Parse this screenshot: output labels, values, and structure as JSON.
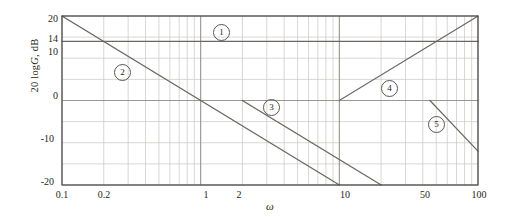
{
  "figure": {
    "type": "bode-magnitude-plot",
    "axes": {
      "y_label": "20 log|G|, dB",
      "y_label_prefix": "20 log",
      "y_label_italic": "G",
      "y_label_suffix": ", dB",
      "x_label": "ω",
      "y_ticks": [
        "20",
        "14",
        "10",
        "0",
        "-10",
        "-20"
      ],
      "y_tick_values": [
        20,
        14,
        10,
        0,
        -10,
        -20
      ],
      "x_ticks": [
        "0.1",
        "0.2",
        "1",
        "2",
        "10",
        "50",
        "100"
      ],
      "x_tick_values": [
        0.1,
        0.2,
        1,
        2,
        10,
        50,
        100
      ],
      "ylim": [
        -20,
        20
      ],
      "xlim": [
        0.1,
        100
      ],
      "xscale": "log",
      "grid": "on"
    },
    "curve_labels": [
      {
        "id": "1",
        "glyph": "①",
        "text": "1"
      },
      {
        "id": "2",
        "glyph": "②",
        "text": "2"
      },
      {
        "id": "3",
        "glyph": "③",
        "text": "3"
      },
      {
        "id": "4",
        "glyph": "④",
        "text": "4"
      },
      {
        "id": "5",
        "glyph": "⑤",
        "text": "5"
      }
    ],
    "colors": {
      "curve": "#6b6764",
      "grid_major": "#8d8a87",
      "grid_minor": "#c9c6c3",
      "frame": "#4a4745",
      "text": "#231f20"
    }
  },
  "chart_data": {
    "type": "line",
    "title": "",
    "xlabel": "ω",
    "ylabel": "20 log|G|, dB",
    "xscale": "log",
    "xlim": [
      0.1,
      100
    ],
    "ylim": [
      -20,
      20
    ],
    "grid": "on",
    "legend": "inline-circled-numbers",
    "x_tick_labels": [
      "0.1",
      "0.2",
      "1",
      "2",
      "10",
      "50",
      "100"
    ],
    "y_tick_labels": [
      "20",
      "14",
      "10",
      "0",
      "-10",
      "-20"
    ],
    "series": [
      {
        "name": "1",
        "label": "①",
        "slope_db_per_decade": 0,
        "points": [
          [
            0.1,
            14
          ],
          [
            100,
            14
          ]
        ],
        "label_position": [
          1.8,
          17
        ]
      },
      {
        "name": "2",
        "label": "②",
        "slope_db_per_decade": -20,
        "points": [
          [
            0.1,
            20
          ],
          [
            10,
            -20
          ]
        ],
        "label_position": [
          0.31,
          8.5
        ]
      },
      {
        "name": "3",
        "label": "③",
        "slope_db_per_decade": -20,
        "points": [
          [
            2,
            0
          ],
          [
            20,
            -20
          ]
        ],
        "label_position": [
          3.1,
          -2.6
        ]
      },
      {
        "name": "4",
        "label": "④",
        "slope_db_per_decade": 20,
        "points": [
          [
            10,
            0
          ],
          [
            100,
            20
          ]
        ],
        "label_position": [
          26,
          3.5
        ]
      },
      {
        "name": "5",
        "label": "⑤",
        "slope_db_per_decade": -20,
        "points": [
          [
            45,
            0
          ],
          [
            100,
            -12
          ]
        ],
        "label_position": [
          53,
          -7
        ]
      }
    ]
  }
}
